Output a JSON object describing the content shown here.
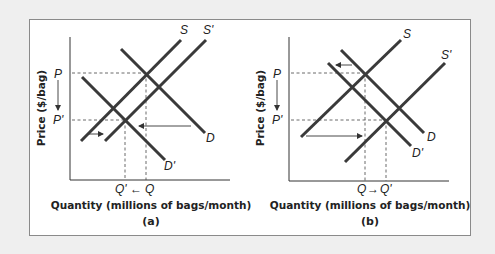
{
  "figure": {
    "background": "#efefef",
    "frame_color": "#8a8a8a",
    "line_color": "#3a3a3a"
  },
  "panels": [
    {
      "id": "a",
      "caption": "(a)",
      "x_axis_label": "Quantity (millions of bags/month)",
      "y_axis_label": "Price ($/bag)",
      "price_labels": {
        "P": "P",
        "P_prime": "P'"
      },
      "quantity_labels": {
        "left": "Q'",
        "arrow": "←",
        "right": "Q"
      },
      "curve_labels": {
        "S": "S",
        "S_prime": "S'",
        "D": "D",
        "D_prime": "D'"
      },
      "description": "Supply shifts right slightly (S→S'), demand shifts left greatly (D→D'); price falls P→P', quantity falls Q→Q'"
    },
    {
      "id": "b",
      "caption": "(b)",
      "x_axis_label": "Quantity (millions of bags/month)",
      "y_axis_label": "Price ($/bag)",
      "price_labels": {
        "P": "P",
        "P_prime": "P'"
      },
      "quantity_labels": {
        "left": "Q",
        "arrow": "→",
        "right": "Q'"
      },
      "curve_labels": {
        "S": "S",
        "S_prime": "S'",
        "D": "D",
        "D_prime": "D'"
      },
      "description": "Supply shifts right greatly (S→S'), demand shifts left slightly (D→D'); price falls P→P', quantity rises Q→Q'"
    }
  ]
}
